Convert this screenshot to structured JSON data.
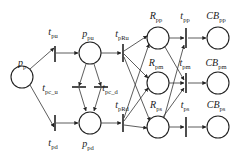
{
  "diagram": {
    "type": "petri-net",
    "places": [
      {
        "id": "p_p",
        "base": "p",
        "sub": "p",
        "cx": 22,
        "cy": 77,
        "lx": 22,
        "ly": 66
      },
      {
        "id": "p_pu",
        "base": "p",
        "sub": "pu",
        "cx": 90,
        "cy": 53,
        "lx": 88,
        "ly": 37
      },
      {
        "id": "p_pd",
        "base": "p",
        "sub": "pd",
        "cx": 90,
        "cy": 123,
        "lx": 88,
        "ly": 147
      },
      {
        "id": "R_pp",
        "base": "R",
        "sub": "pp",
        "cx": 158,
        "cy": 38,
        "lx": 156,
        "ly": 19
      },
      {
        "id": "R_pm",
        "base": "R",
        "sub": "pm",
        "cx": 158,
        "cy": 83,
        "lx": 156,
        "ly": 66
      },
      {
        "id": "R_ps",
        "base": "R",
        "sub": "ps",
        "cx": 158,
        "cy": 127,
        "lx": 156,
        "ly": 108
      },
      {
        "id": "CB_pp",
        "base": "CB",
        "sub": "pp",
        "cx": 218,
        "cy": 38,
        "lx": 216,
        "ly": 19
      },
      {
        "id": "CB_pm",
        "base": "CB",
        "sub": "pm",
        "cx": 218,
        "cy": 83,
        "lx": 216,
        "ly": 66
      },
      {
        "id": "CB_ps",
        "base": "CB",
        "sub": "ps",
        "cx": 218,
        "cy": 127,
        "lx": 216,
        "ly": 108
      }
    ],
    "transitions": [
      {
        "id": "t_pu",
        "base": "t",
        "sub": "pu",
        "x": 55,
        "y1": 46,
        "y2": 62,
        "lx": 53,
        "ly": 35
      },
      {
        "id": "t_pd",
        "base": "t",
        "sub": "pd",
        "x": 55,
        "y1": 115,
        "y2": 131,
        "lx": 53,
        "ly": 146
      },
      {
        "id": "t_pRu",
        "base": "t",
        "sub": "pRu",
        "x": 123,
        "y1": 44,
        "y2": 62,
        "lx": 122,
        "ly": 37
      },
      {
        "id": "t_pRd",
        "base": "t",
        "sub": "pRd",
        "x": 123,
        "y1": 114,
        "y2": 132,
        "lx": 122,
        "ly": 108
      },
      {
        "id": "t_pp",
        "base": "t",
        "sub": "pp",
        "x": 186,
        "y1": 28,
        "y2": 48,
        "lx": 185,
        "ly": 19
      },
      {
        "id": "t_pm",
        "base": "t",
        "sub": "pm",
        "x": 186,
        "y1": 73,
        "y2": 93,
        "lx": 185,
        "ly": 66
      },
      {
        "id": "t_ps",
        "base": "t",
        "sub": "ps",
        "x": 186,
        "y1": 117,
        "y2": 137,
        "lx": 185,
        "ly": 108
      }
    ],
    "horizontal_transitions": [
      {
        "id": "t_pc_u",
        "base": "t",
        "sub": "pc_u",
        "x1": 72,
        "x2": 86,
        "y": 87,
        "lx": 50,
        "ly": 91
      },
      {
        "id": "t_pc_d",
        "base": "t",
        "sub": "pc_d",
        "x1": 94,
        "x2": 108,
        "y": 87,
        "lx": 110,
        "ly": 91
      }
    ],
    "arcs": [
      {
        "x1": 30,
        "y1": 69,
        "x2": 54,
        "y2": 48
      },
      {
        "x1": 30,
        "y1": 85,
        "x2": 54,
        "y2": 127
      },
      {
        "x1": 56,
        "y1": 53,
        "x2": 78,
        "y2": 53
      },
      {
        "x1": 56,
        "y1": 123,
        "x2": 78,
        "y2": 123
      },
      {
        "x1": 101,
        "y1": 53,
        "x2": 121,
        "y2": 53
      },
      {
        "x1": 101,
        "y1": 123,
        "x2": 121,
        "y2": 123
      },
      {
        "x1": 86,
        "y1": 64,
        "x2": 79,
        "y2": 86
      },
      {
        "x1": 79,
        "y1": 88,
        "x2": 86,
        "y2": 111
      },
      {
        "x1": 94,
        "y1": 64,
        "x2": 101,
        "y2": 86
      },
      {
        "x1": 101,
        "y1": 88,
        "x2": 94,
        "y2": 111
      },
      {
        "x1": 124,
        "y1": 51,
        "x2": 147,
        "y2": 36
      },
      {
        "x1": 124,
        "y1": 54,
        "x2": 148,
        "y2": 78
      },
      {
        "x1": 124,
        "y1": 57,
        "x2": 150,
        "y2": 121
      },
      {
        "x1": 124,
        "y1": 118,
        "x2": 149,
        "y2": 44
      },
      {
        "x1": 124,
        "y1": 121,
        "x2": 148,
        "y2": 88
      },
      {
        "x1": 124,
        "y1": 125,
        "x2": 147,
        "y2": 128
      },
      {
        "x1": 169,
        "y1": 38,
        "x2": 184,
        "y2": 38
      },
      {
        "x1": 165,
        "y1": 47,
        "x2": 184,
        "y2": 80
      },
      {
        "x1": 169,
        "y1": 83,
        "x2": 184,
        "y2": 83
      },
      {
        "x1": 164,
        "y1": 118,
        "x2": 184,
        "y2": 45
      },
      {
        "x1": 163,
        "y1": 117,
        "x2": 184,
        "y2": 88
      },
      {
        "x1": 169,
        "y1": 127,
        "x2": 184,
        "y2": 127
      },
      {
        "x1": 188,
        "y1": 38,
        "x2": 206,
        "y2": 38
      },
      {
        "x1": 188,
        "y1": 83,
        "x2": 206,
        "y2": 83
      },
      {
        "x1": 188,
        "y1": 127,
        "x2": 206,
        "y2": 127
      }
    ]
  }
}
